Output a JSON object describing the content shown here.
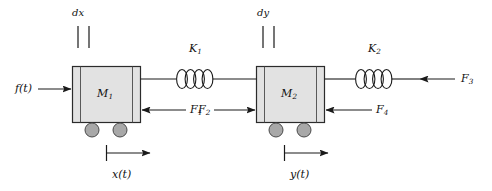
{
  "diagram": {
    "background_color": "#ffffff",
    "line_color": "#1a1a1a",
    "block_fill": "#e2e2e2",
    "block_edge": "#2b2b2b",
    "wheel_fill": "#a8a8a8",
    "wheel_edge": "#4a4a4a"
  },
  "masses": [
    {
      "id": "mass-1",
      "label": "M",
      "subscript": "1"
    },
    {
      "id": "mass-2",
      "label": "M",
      "subscript": "2"
    }
  ],
  "springs": [
    {
      "id": "spring-k1",
      "label": "K",
      "subscript": "1",
      "coils": 4
    },
    {
      "id": "spring-k2",
      "label": "K",
      "subscript": "2",
      "coils": 4
    }
  ],
  "dampers": [
    {
      "id": "damper-dx",
      "label": "dx"
    },
    {
      "id": "damper-dy",
      "label": "dy"
    }
  ],
  "forces": [
    {
      "id": "force-ft",
      "label": "f(t)",
      "subscript": "",
      "direction": "right"
    },
    {
      "id": "force-f1",
      "label": "F",
      "subscript": "1",
      "direction": "left"
    },
    {
      "id": "force-f2",
      "label": "F",
      "subscript": "2",
      "direction": "right"
    },
    {
      "id": "force-f4",
      "label": "F",
      "subscript": "4",
      "direction": "left"
    },
    {
      "id": "force-f3",
      "label": "F",
      "subscript": "3",
      "direction": "left"
    }
  ],
  "displacements": [
    {
      "id": "displacement-x",
      "label": "x(t)",
      "direction": "right"
    },
    {
      "id": "displacement-y",
      "label": "y(t)",
      "direction": "right"
    }
  ]
}
